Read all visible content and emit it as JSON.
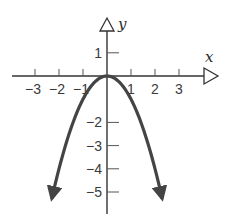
{
  "chart_data": {
    "type": "line",
    "title": "",
    "function": "y = -x^2",
    "xlabel": "x",
    "ylabel": "y",
    "x_ticks": [
      -3,
      -2,
      -1,
      1,
      2,
      3
    ],
    "x_tick_labels": [
      "−3",
      "−2",
      "−1",
      "1",
      "2",
      "3"
    ],
    "y_ticks": [
      1,
      -2,
      -3,
      -4,
      -5
    ],
    "y_tick_labels": [
      "1",
      "−2",
      "−3",
      "−4",
      "−5"
    ],
    "xlim": [
      -3.9,
      4.6
    ],
    "ylim": [
      -5.9,
      2.5
    ],
    "grid": false,
    "legend": null,
    "series": [
      {
        "name": "parabola",
        "color": "#444444",
        "x": [
          -2.3,
          -2,
          -1.5,
          -1,
          -0.5,
          0,
          0.5,
          1,
          1.5,
          2,
          2.3
        ],
        "y": [
          -5.29,
          -4,
          -2.25,
          -1,
          -0.25,
          0,
          -0.25,
          -1,
          -2.25,
          -4,
          -5.29
        ],
        "arrows_at_ends": true
      }
    ]
  },
  "axes": {
    "x_name": "x",
    "y_name": "y",
    "axis_color": "#333333",
    "arrow_style": "open-triangle"
  }
}
